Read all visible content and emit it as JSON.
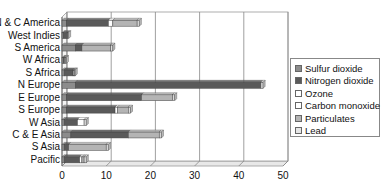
{
  "chart_data": {
    "type": "bar",
    "orientation": "horizontal",
    "stacked": true,
    "title": "",
    "xlabel": "",
    "ylabel": "",
    "xlim": [
      0,
      50
    ],
    "x_ticks": [
      0,
      10,
      20,
      30,
      40,
      50
    ],
    "grid": true,
    "legend_position": "right",
    "categories": [
      "N & C America",
      "West Indies",
      "S America",
      "W Africa",
      "S Africa",
      "N Europe",
      "E Europe",
      "S Europe",
      "W Asia",
      "C & E Asia",
      "S Asia",
      "Pacific"
    ],
    "series": [
      {
        "name": "Sulfur dioxide",
        "color": "#8c8c8c",
        "values": [
          1,
          0.3,
          3,
          0.3,
          0.5,
          3,
          1,
          1,
          0.5,
          2,
          0.5,
          0.5
        ]
      },
      {
        "name": "Nitrogen dioxide",
        "color": "#5a5a5a",
        "values": [
          9.5,
          1,
          1.5,
          0.3,
          2,
          42,
          17,
          11,
          3,
          13,
          1,
          3.5
        ]
      },
      {
        "name": "Ozone",
        "color": "#ffffff",
        "values": [
          1,
          0,
          0,
          0.2,
          0,
          0,
          0,
          0.5,
          1.5,
          0,
          0,
          0.5
        ]
      },
      {
        "name": "Carbon monoxide",
        "color": "#f2f2f2",
        "values": [
          0,
          0,
          0,
          0,
          0,
          0,
          0,
          0,
          0,
          0,
          0,
          0
        ]
      },
      {
        "name": "Particulates",
        "color": "#b4b4b4",
        "values": [
          5.5,
          0,
          6.5,
          0,
          0.3,
          0,
          7,
          2.5,
          0,
          7,
          8.5,
          0.5
        ]
      },
      {
        "name": "Lead",
        "color": "#dcdcdc",
        "values": [
          0.5,
          0.2,
          0.5,
          0.2,
          0.2,
          0.5,
          0.5,
          0.5,
          0.5,
          0.5,
          0.5,
          0.5
        ]
      }
    ]
  },
  "legend": {
    "items": [
      {
        "label": "Sulfur dioxide",
        "color": "#8c8c8c"
      },
      {
        "label": "Nitrogen dioxide",
        "color": "#5a5a5a"
      },
      {
        "label": "Ozone",
        "color": "#ffffff"
      },
      {
        "label": "Carbon monoxide",
        "color": "#ffffff"
      },
      {
        "label": "Particulates",
        "color": "#b4b4b4"
      },
      {
        "label": "Lead",
        "color": "#e6e6e6"
      }
    ]
  },
  "axis": {
    "tick_labels": [
      "0",
      "10",
      "20",
      "30",
      "40",
      "50"
    ]
  }
}
